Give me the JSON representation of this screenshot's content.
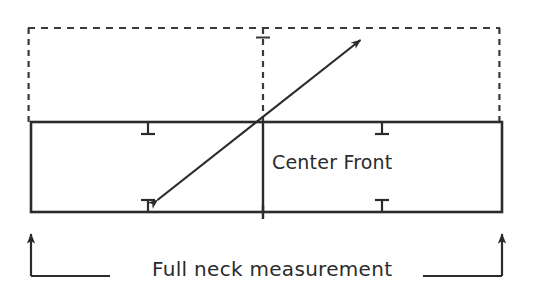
{
  "diagram": {
    "type": "technical-sewing-pattern",
    "colors": {
      "stroke": "#2b2b2b",
      "dashed_stroke": "#3a3a3a",
      "text": "#2b2b2b",
      "background": "#ffffff"
    },
    "labels": {
      "center_front": "Center Front",
      "full_neck_measurement": "Full neck measurement"
    },
    "solid_rectangle": {
      "name": "neck-band-rectangle",
      "x": 31,
      "y": 122,
      "width": 471,
      "height": 90,
      "stroke_width": 2.6
    },
    "dashed_rectangle": {
      "name": "upper-guide-rectangle",
      "x": 28,
      "y": 28,
      "width": 472,
      "height": 94,
      "stroke_width": 2.2,
      "dash_pattern": "7 6"
    },
    "center_front_line": {
      "name": "center-front-divider",
      "x": 263,
      "y1": 122,
      "y2": 212,
      "stroke_width": 2.4
    },
    "center_front_dashed_line": {
      "name": "center-front-guide",
      "x": 263,
      "y1": 28,
      "y2": 122,
      "stroke_width": 2.2,
      "dash_pattern": "6 5"
    },
    "diagonal_arrow": {
      "name": "diagonal-double-arrow",
      "x1": 155,
      "y1": 202,
      "x2": 363,
      "y2": 38,
      "stroke_width": 2.2,
      "heads": "both"
    },
    "tick_marks": [
      {
        "name": "tick-top-left",
        "x": 148,
        "edge": "top",
        "length": 12
      },
      {
        "name": "tick-top-right",
        "x": 382,
        "edge": "top",
        "length": 12
      },
      {
        "name": "tick-bottom-left",
        "x": 148,
        "edge": "bottom",
        "length": 12
      },
      {
        "name": "tick-bottom-right",
        "x": 382,
        "edge": "bottom",
        "length": 12
      },
      {
        "name": "tick-center-top",
        "x": 263,
        "edge": "dashed-top",
        "length": 10
      }
    ],
    "center_bottom_cross": {
      "name": "center-front-bottom-tick",
      "x": 263,
      "y": 212,
      "half_length": 7
    },
    "measurement_brackets": [
      {
        "name": "bracket-left",
        "arrow_x": 31,
        "arrow_top_y": 228,
        "corner_y": 276,
        "horizontal_end_x": 110,
        "direction": "right"
      },
      {
        "name": "bracket-right",
        "arrow_x": 502,
        "arrow_top_y": 228,
        "corner_y": 276,
        "horizontal_end_x": 423,
        "direction": "left"
      }
    ]
  }
}
